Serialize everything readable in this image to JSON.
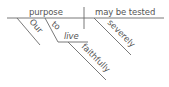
{
  "diagram": {
    "type": "sentence-diagram",
    "sentence": "Our purpose to live faithfully may be tested severely.",
    "subject": "purpose",
    "predicate": "may be tested",
    "modifiers": {
      "subject": [
        {
          "word": "Our",
          "role": "possessive modifier"
        },
        {
          "word": "to",
          "role": "infinitive marker"
        }
      ],
      "infinitive_verb": "live",
      "infinitive_modifier": "faithfully",
      "predicate": [
        {
          "word": "severely",
          "role": "adverb"
        }
      ]
    },
    "colors": {
      "line": "#6a6a6a",
      "text": "#555555",
      "background": "#ffffff"
    }
  }
}
